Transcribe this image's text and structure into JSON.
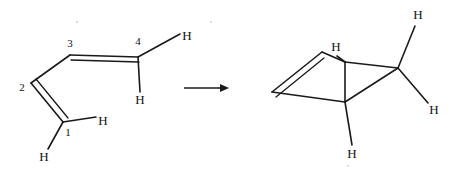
{
  "figure": {
    "kind": "chemical-reaction-scheme",
    "background_color": "#ffffff",
    "ink_color": "#1a1a1a"
  },
  "reactant": {
    "name": "s-cis-1,3-butadiene",
    "carbon_numbers": [
      {
        "label": "1",
        "x": 68,
        "y": 133
      },
      {
        "label": "2",
        "x": 22,
        "y": 88
      },
      {
        "label": "3",
        "x": 70,
        "y": 44
      },
      {
        "label": "4",
        "x": 138,
        "y": 42
      }
    ],
    "hydrogens": [
      {
        "label": "H",
        "x": 103,
        "y": 122,
        "attached_to": "1"
      },
      {
        "label": "H",
        "x": 44,
        "y": 158,
        "attached_to": "1"
      },
      {
        "label": "H",
        "x": 187,
        "y": 37,
        "attached_to": "4"
      },
      {
        "label": "H",
        "x": 140,
        "y": 101,
        "attached_to": "4"
      }
    ],
    "skeleton": {
      "c1": {
        "x": 63,
        "y": 122
      },
      "c2": {
        "x": 31,
        "y": 83
      },
      "c3": {
        "x": 70,
        "y": 55
      },
      "c4": {
        "x": 138,
        "y": 57
      }
    },
    "double_bonds": [
      "C1=C2",
      "C3=C4"
    ],
    "single_bonds": [
      "C2-C3"
    ]
  },
  "arrow": {
    "name": "reaction-arrow",
    "direction": "right",
    "x_start": 184,
    "x_end": 229,
    "y": 88,
    "label": ""
  },
  "product": {
    "name": "bicyclic cyclobutene product",
    "hydrogens": [
      {
        "label": "H",
        "x": 336,
        "y": 48,
        "attached_to": "bridgehead"
      },
      {
        "label": "H",
        "x": 418,
        "y": 16,
        "attached_to": "ch2"
      },
      {
        "label": "H",
        "x": 434,
        "y": 111,
        "attached_to": "ch2"
      },
      {
        "label": "H",
        "x": 352,
        "y": 155,
        "attached_to": "bridgehead-lower"
      }
    ],
    "skeleton": {
      "alkene_left": {
        "x": 272,
        "y": 92
      },
      "alkene_top": {
        "x": 322,
        "y": 52
      },
      "bridge_upper": {
        "x": 345,
        "y": 62
      },
      "bridge_lower": {
        "x": 345,
        "y": 102
      },
      "ch2": {
        "x": 398,
        "y": 68
      }
    },
    "double_bonds": [
      "alkene_left=alkene_top"
    ],
    "ring_type": "four-membered"
  }
}
